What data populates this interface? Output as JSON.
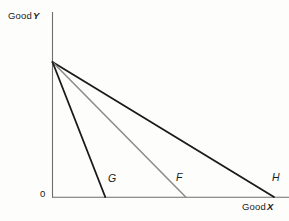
{
  "figure": {
    "background_color": "#fdfdfc",
    "axis_color": "#6e6e6e",
    "origin_label": "0"
  },
  "axes": {
    "y": {
      "label_prefix": "Good",
      "label_var": "Y"
    },
    "x": {
      "label_prefix": "Good",
      "label_var": "X"
    }
  },
  "chart_data": {
    "type": "line",
    "title": "",
    "xlabel": "Good X",
    "ylabel": "Good Y",
    "grid": false,
    "legend": "inline-endpoint-labels",
    "xlim": [
      0,
      10
    ],
    "ylim": [
      0,
      6
    ],
    "common_y_intercept": 6,
    "series": [
      {
        "name": "G",
        "label": "G",
        "color": "#1a1a1a",
        "width": 1.8,
        "points": [
          [
            0,
            6
          ],
          [
            2.36,
            0
          ]
        ],
        "x_intercept": 2.36,
        "y_intercept": 6,
        "label_position": [
          2.5,
          0.75
        ]
      },
      {
        "name": "F",
        "label": "F",
        "color": "#8d8d8d",
        "width": 1.6,
        "points": [
          [
            0,
            6
          ],
          [
            5.96,
            0
          ]
        ],
        "x_intercept": 5.96,
        "y_intercept": 6,
        "label_position": [
          5.6,
          0.8
        ]
      },
      {
        "name": "H",
        "label": "H",
        "color": "#1a1a1a",
        "width": 1.8,
        "points": [
          [
            0,
            6
          ],
          [
            9.91,
            0
          ]
        ],
        "x_intercept": 9.91,
        "y_intercept": 6,
        "label_position": [
          9.9,
          0.8
        ]
      }
    ]
  }
}
